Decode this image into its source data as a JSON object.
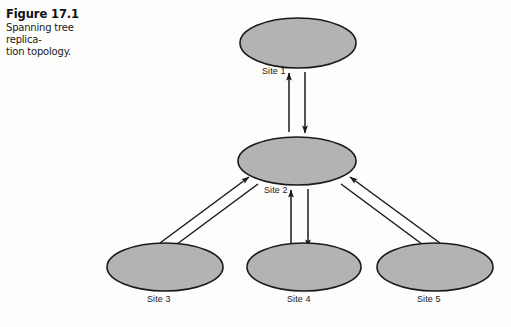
{
  "figure": {
    "number_label": "Figure 17.1",
    "caption_line1": "Spanning tree replica-",
    "caption_line2": "tion topology."
  },
  "colors": {
    "node_fill": "#b3b3b3",
    "node_stroke": "#1a1a1a",
    "arrow": "#1a1a1a",
    "text": "#1a1a1a",
    "page_background": "#fdfdfc"
  },
  "diagram": {
    "type": "spanning-tree-replication-topology",
    "nodes": [
      {
        "id": "site1",
        "label": "Site 1",
        "cx": 298,
        "cy": 43,
        "rx": 58,
        "ry": 25
      },
      {
        "id": "site2",
        "label": "Site 2",
        "cx": 297,
        "cy": 161,
        "rx": 59,
        "ry": 24
      },
      {
        "id": "site3",
        "label": "Site 3",
        "cx": 165,
        "cy": 267,
        "rx": 58,
        "ry": 24
      },
      {
        "id": "site4",
        "label": "Site 4",
        "cx": 304,
        "cy": 267,
        "rx": 57,
        "ry": 24
      },
      {
        "id": "site5",
        "label": "Site 5",
        "cx": 435,
        "cy": 267,
        "rx": 58,
        "ry": 24
      }
    ],
    "links": [
      {
        "from": "site1",
        "to": "site2",
        "direction": "bidirectional",
        "style": "double-arrow-pair"
      },
      {
        "from": "site2",
        "to": "site3",
        "direction": "bidirectional",
        "style": "double-arrow-pair"
      },
      {
        "from": "site2",
        "to": "site4",
        "direction": "bidirectional",
        "style": "double-arrow-pair"
      },
      {
        "from": "site2",
        "to": "site5",
        "direction": "bidirectional",
        "style": "double-arrow-pair"
      }
    ],
    "labels": {
      "site1": "Site 1",
      "site2": "Site 2",
      "site3": "Site 3",
      "site4": "Site 4",
      "site5": "Site 5"
    }
  }
}
